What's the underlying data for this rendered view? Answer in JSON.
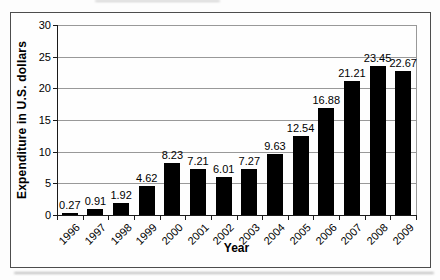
{
  "chart_data": {
    "type": "bar",
    "categories": [
      "1996",
      "1997",
      "1998",
      "1999",
      "2000",
      "2001",
      "2002",
      "2003",
      "2004",
      "2005",
      "2006",
      "2007",
      "2008",
      "2009"
    ],
    "values": [
      0.27,
      0.91,
      1.92,
      4.62,
      8.23,
      7.21,
      6.01,
      7.27,
      9.63,
      12.54,
      16.88,
      21.21,
      23.45,
      22.67
    ],
    "value_labels": [
      "0.27",
      "0.91",
      "1.92",
      "4.62",
      "8.23",
      "7.21",
      "6.01",
      "7.27",
      "9.63",
      "12.54",
      "16.88",
      "21.21",
      "23.45",
      "22.67"
    ],
    "title": "",
    "xlabel": "Year",
    "ylabel": "Expenditure in U.S. dollars",
    "ylim": [
      0,
      30
    ],
    "yticks": [
      0,
      5,
      10,
      15,
      20,
      25,
      30
    ],
    "grid": true,
    "legend": "none",
    "bar_color": "#000000",
    "gridline_color": "#999999",
    "axis_color": "#1a1a1a",
    "frame_border_color": "#4d4d4d",
    "x_tick_label_rotation_deg": -45
  }
}
